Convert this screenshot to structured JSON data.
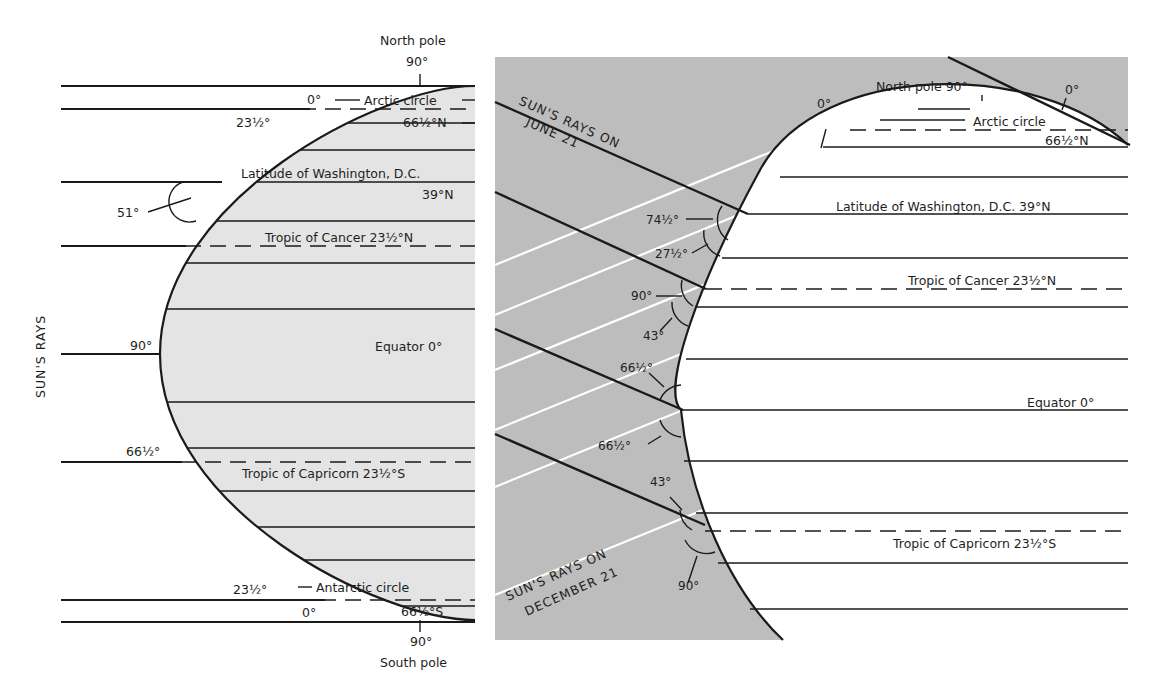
{
  "left_panel": {
    "side_label": "SUN'S RAYS",
    "top": {
      "pole_label": "North pole",
      "pole_angle": "90°"
    },
    "bottom": {
      "pole_label": "South pole",
      "pole_angle": "90°"
    },
    "latitudes": {
      "arctic": "Arctic circle",
      "arctic_deg": "66½°N",
      "washington": "Latitude of Washington, D.C.",
      "washington_deg": "39°N",
      "cancer": "Tropic of Cancer  23½°N",
      "equator": "Equator  0°",
      "capricorn": "Tropic of Capricorn  23½°S",
      "antarctic": "Antarctic circle",
      "antarctic_deg": "66½°S"
    },
    "angles": {
      "north_zero": "0°",
      "north_23": "23½°",
      "washington": "51°",
      "equator": "90°",
      "capricorn": "66½°",
      "south_23": "23½°",
      "south_zero": "0°"
    }
  },
  "right_panel": {
    "june_label_line1": "SUN'S RAYS ON",
    "june_label_line2": "JUNE 21",
    "december_label_line1": "SUN'S RAYS ON",
    "december_label_line2": "DECEMBER 21",
    "north_pole": "North pole 90°",
    "latitudes": {
      "arctic": "Arctic circle",
      "arctic_deg": "66½°N",
      "washington": "Latitude of Washington, D.C.  39°N",
      "cancer": "Tropic of Cancer  23½°N",
      "equator": "Equator  0°",
      "capricorn": "Tropic of Capricorn  23½°S"
    },
    "angles": {
      "arctic_june": "0°",
      "arctic_dec": "0°",
      "wash_june": "74½°",
      "wash_dec": "27½°",
      "cancer_june": "90°",
      "cancer_dec": "43°",
      "equator_june": "66½°",
      "equator_dec": "66½°",
      "capricorn_june": "43°",
      "capricorn_dec": "90°"
    }
  },
  "colors": {
    "land_fill": "#e4e4e4",
    "space_fill": "#bdbdbd",
    "line": "#1a1a1a",
    "ray_white": "#ffffff"
  }
}
